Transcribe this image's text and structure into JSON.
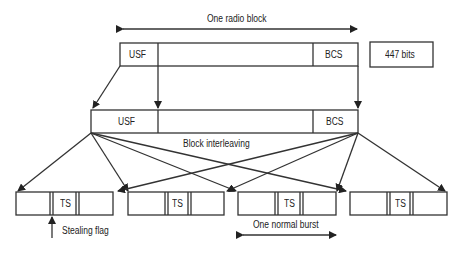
{
  "diagram": {
    "top_label": "One radio block",
    "top_block": {
      "left": "USF",
      "right": "BCS"
    },
    "bits_label": "447 bits",
    "middle_block": {
      "left": "USF",
      "right": "BCS"
    },
    "interleave_label": "Block interleaving",
    "bursts": [
      {
        "center": "TS"
      },
      {
        "center": "TS"
      },
      {
        "center": "TS"
      },
      {
        "center": "TS"
      }
    ],
    "stealing_label": "Stealing flag",
    "burst_label": "One normal burst"
  }
}
